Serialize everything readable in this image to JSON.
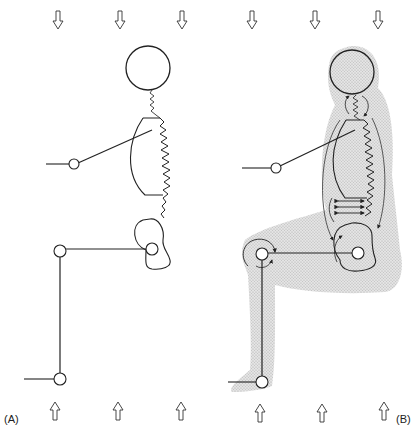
{
  "figure": {
    "panels": [
      {
        "id": "A",
        "label": "(A)",
        "description": "Seated figure, rigid segments with springs"
      },
      {
        "id": "B",
        "label": "(B)",
        "description": "Seated figure with soft tissue and muscle actions"
      }
    ],
    "colors": {
      "line": "#222222",
      "tissue_shading": "#d4d4d4",
      "arrow_fill": "#ffffff"
    },
    "load_arrows": {
      "top_count_per_panel": 3,
      "bottom_count_per_panel": 3,
      "top_direction": "down",
      "bottom_direction": "up"
    }
  }
}
